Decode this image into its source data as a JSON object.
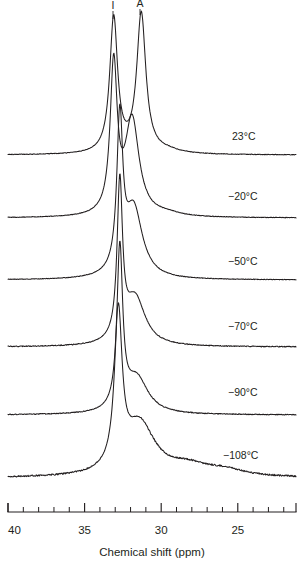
{
  "figure": {
    "type": "nmr-spectra-stack",
    "background_color": "#ffffff",
    "trace_color": "#231f20"
  },
  "peak_labels": [
    {
      "name": "I",
      "text": "I",
      "ppm": 33.1,
      "x": 113
    },
    {
      "name": "A",
      "text": "A",
      "ppm": 31.3,
      "x": 140
    }
  ],
  "temperatures": [
    {
      "label": "23°C",
      "x": 232,
      "y": 140
    },
    {
      "label": "−20°C",
      "x": 228,
      "y": 200
    },
    {
      "label": "−50°C",
      "x": 228,
      "y": 265
    },
    {
      "label": "−70°C",
      "x": 228,
      "y": 330
    },
    {
      "label": "−90°C",
      "x": 228,
      "y": 396
    },
    {
      "label": "−108°C",
      "x": 223,
      "y": 459
    }
  ],
  "axis": {
    "title": "Chemical shift (ppm)",
    "title_x": 152,
    "title_y": 556,
    "label_y": 534,
    "line_y": 512,
    "major_tick_len": 9,
    "minor_tick_len": 5,
    "left_px": 8,
    "right_px": 296,
    "ppm_at_left": 40,
    "ppm_at_right": 21.2,
    "major_ticks": [
      {
        "ppm": 40,
        "label": "40",
        "x": 8
      },
      {
        "ppm": 35,
        "label": "35",
        "x": 84.6
      },
      {
        "ppm": 30,
        "label": "30",
        "x": 161.2
      },
      {
        "ppm": 25,
        "label": "25",
        "x": 237.8
      }
    ],
    "minor_ppm": [
      39,
      38,
      37,
      36,
      34,
      33,
      32,
      31,
      29,
      28,
      27,
      26,
      24,
      23,
      22
    ]
  },
  "chart_data": {
    "type": "line",
    "title": "",
    "xlabel": "Chemical shift (ppm)",
    "ylabel": "",
    "xlim": [
      40,
      21.2
    ],
    "x_axis_inverted": true,
    "grid": false,
    "legend": "right-inline-temperature-labels",
    "annotations": [
      {
        "text": "I",
        "ppm": 33.1,
        "note": "isotactic / peak I on top trace"
      },
      {
        "text": "A",
        "ppm": 31.3,
        "note": "atactic / peak A on top trace"
      }
    ],
    "series": [
      {
        "name": "23°C",
        "baseline_y": 155,
        "peaks": [
          {
            "ppm": 33.1,
            "height_px": 135,
            "width_ppm": 0.62
          },
          {
            "ppm": 31.3,
            "height_px": 139,
            "width_ppm": 0.72
          }
        ],
        "description": "Two well-resolved sharp peaks of nearly equal height, valley between them reaching about 2/3 height."
      },
      {
        "name": "−20°C",
        "baseline_y": 218,
        "peaks": [
          {
            "ppm": 33.1,
            "height_px": 148,
            "width_ppm": 0.55
          },
          {
            "ppm": 31.9,
            "height_px": 96,
            "width_ppm": 1.1
          }
        ],
        "description": "Main sharp peak with a broad shoulder on the low-field side; peaks beginning to coalesce."
      },
      {
        "name": "−50°C",
        "baseline_y": 280,
        "peaks": [
          {
            "ppm": 32.7,
            "height_px": 150,
            "width_ppm": 0.46
          },
          {
            "ppm": 31.8,
            "height_px": 70,
            "width_ppm": 1.4
          }
        ],
        "description": "Single tall narrow line with a weak broad shoulder."
      },
      {
        "name": "−70°C",
        "baseline_y": 347,
        "peaks": [
          {
            "ppm": 32.7,
            "height_px": 155,
            "width_ppm": 0.42
          },
          {
            "ppm": 31.7,
            "height_px": 48,
            "width_ppm": 1.6
          }
        ],
        "description": "Very sharp single line, shoulder further reduced."
      },
      {
        "name": "−90°C",
        "baseline_y": 415,
        "peaks": [
          {
            "ppm": 32.7,
            "height_px": 160,
            "width_ppm": 0.45
          },
          {
            "ppm": 31.6,
            "height_px": 36,
            "width_ppm": 1.8
          }
        ],
        "description": "Sharp single line on a broadening base."
      },
      {
        "name": "−108°C",
        "baseline_y": 478,
        "peaks": [
          {
            "ppm": 32.8,
            "height_px": 152,
            "width_ppm": 0.6
          },
          {
            "ppm": 31.4,
            "height_px": 52,
            "width_ppm": 2.4
          }
        ],
        "description": "Broadened line with noisy descending tail toward low field; small bumps near 28 and 26 ppm."
      }
    ]
  }
}
